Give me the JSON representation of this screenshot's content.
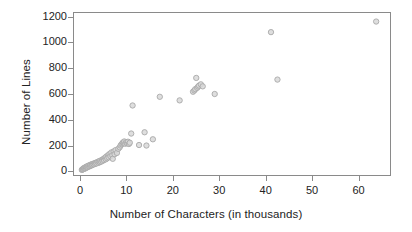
{
  "chart_data": {
    "type": "scatter",
    "title": "",
    "xlabel": "Number of Characters (in thousands)",
    "ylabel": "Number of Lines",
    "xlim": [
      -1.5,
      67
    ],
    "ylim": [
      -35,
      1235
    ],
    "xticks": [
      0,
      10,
      20,
      30,
      40,
      50,
      60
    ],
    "yticks": [
      0,
      200,
      400,
      600,
      800,
      1000,
      1200
    ],
    "grid": false,
    "legend": null,
    "marker": {
      "shape": "circle",
      "fill_color": "#d8d8d8",
      "edge_color": "#a8a8a8",
      "size_px": 5.4,
      "opacity": 0.85
    },
    "series": [
      {
        "name": "files",
        "points": [
          [
            0.2,
            5
          ],
          [
            0.3,
            8
          ],
          [
            0.4,
            12
          ],
          [
            0.5,
            10
          ],
          [
            0.6,
            18
          ],
          [
            0.7,
            14
          ],
          [
            0.8,
            22
          ],
          [
            0.9,
            16
          ],
          [
            1.0,
            26
          ],
          [
            1.1,
            20
          ],
          [
            1.2,
            30
          ],
          [
            1.3,
            24
          ],
          [
            1.4,
            34
          ],
          [
            1.5,
            28
          ],
          [
            1.6,
            38
          ],
          [
            1.8,
            32
          ],
          [
            1.9,
            42
          ],
          [
            2.0,
            36
          ],
          [
            2.1,
            46
          ],
          [
            2.3,
            40
          ],
          [
            2.4,
            50
          ],
          [
            2.5,
            44
          ],
          [
            2.7,
            54
          ],
          [
            2.8,
            48
          ],
          [
            3.0,
            58
          ],
          [
            3.1,
            52
          ],
          [
            3.3,
            62
          ],
          [
            3.4,
            56
          ],
          [
            3.6,
            68
          ],
          [
            3.8,
            60
          ],
          [
            3.9,
            72
          ],
          [
            4.1,
            66
          ],
          [
            4.2,
            78
          ],
          [
            4.4,
            70
          ],
          [
            4.6,
            84
          ],
          [
            4.7,
            76
          ],
          [
            4.9,
            92
          ],
          [
            5.0,
            82
          ],
          [
            5.2,
            100
          ],
          [
            5.4,
            88
          ],
          [
            5.5,
            110
          ],
          [
            5.7,
            96
          ],
          [
            5.9,
            120
          ],
          [
            6.0,
            104
          ],
          [
            6.2,
            130
          ],
          [
            6.4,
            112
          ],
          [
            6.6,
            142
          ],
          [
            6.8,
            120
          ],
          [
            6.9,
            92
          ],
          [
            7.1,
            150
          ],
          [
            7.3,
            128
          ],
          [
            7.5,
            160
          ],
          [
            7.8,
            138
          ],
          [
            8.1,
            170
          ],
          [
            8.4,
            182
          ],
          [
            8.6,
            196
          ],
          [
            8.8,
            206
          ],
          [
            9.0,
            212
          ],
          [
            9.1,
            220
          ],
          [
            9.3,
            216
          ],
          [
            9.4,
            228
          ],
          [
            9.6,
            210
          ],
          [
            9.8,
            222
          ],
          [
            10.0,
            214
          ],
          [
            10.2,
            226
          ],
          [
            10.4,
            208
          ],
          [
            10.6,
            218
          ],
          [
            10.9,
            290
          ],
          [
            11.2,
            510
          ],
          [
            12.6,
            200
          ],
          [
            13.8,
            300
          ],
          [
            14.2,
            196
          ],
          [
            15.6,
            245
          ],
          [
            17.1,
            578
          ],
          [
            21.4,
            550
          ],
          [
            24.3,
            618
          ],
          [
            24.6,
            628
          ],
          [
            24.8,
            638
          ],
          [
            25.0,
            726
          ],
          [
            25.2,
            648
          ],
          [
            25.4,
            658
          ],
          [
            25.6,
            666
          ],
          [
            26.0,
            676
          ],
          [
            26.4,
            660
          ],
          [
            29.0,
            600
          ],
          [
            41.2,
            1085
          ],
          [
            42.6,
            713
          ],
          [
            64.0,
            1168
          ]
        ]
      }
    ]
  },
  "axes": {
    "y_tick_labels": [
      "0",
      "200",
      "400",
      "600",
      "800",
      "1000",
      "1200"
    ],
    "x_tick_labels": [
      "0",
      "10",
      "20",
      "30",
      "40",
      "50",
      "60"
    ]
  }
}
